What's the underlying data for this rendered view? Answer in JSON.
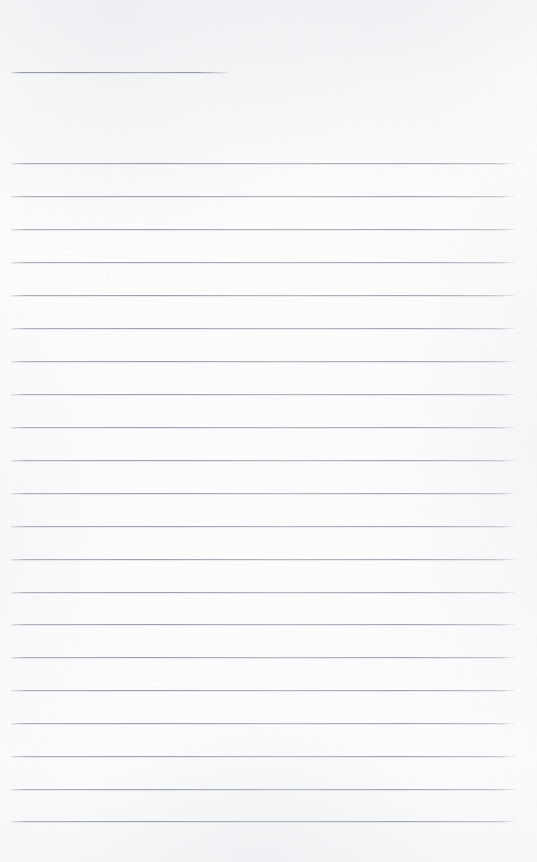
{
  "document": {
    "type": "scanned-lined-paper",
    "title": "Blank Lined Notebook Page",
    "page_width": 537,
    "page_height": 862,
    "content_text": "",
    "is_blank": true
  },
  "colors": {
    "paper": "#fcfcfd",
    "paper_edge": "#f6f7f8",
    "rule_line": "#9aa1ad",
    "rule_line_faint": "#c6cad3"
  },
  "layout": {
    "rule_left": 11,
    "rule_right": 515,
    "header_rule_right": 228,
    "line_spacing": 32.9
  },
  "rules": [
    {
      "name": "header-rule",
      "y": 72,
      "left": 11,
      "width": 217,
      "header": true
    },
    {
      "name": "rule-1",
      "y": 163,
      "left": 11,
      "width": 504,
      "header": false
    },
    {
      "name": "rule-2",
      "y": 196,
      "left": 11,
      "width": 504,
      "header": false
    },
    {
      "name": "rule-3",
      "y": 229,
      "left": 11,
      "width": 504,
      "header": false
    },
    {
      "name": "rule-4",
      "y": 262,
      "left": 11,
      "width": 504,
      "header": false
    },
    {
      "name": "rule-5",
      "y": 295,
      "left": 11,
      "width": 504,
      "header": false
    },
    {
      "name": "rule-6",
      "y": 328,
      "left": 11,
      "width": 504,
      "header": false
    },
    {
      "name": "rule-7",
      "y": 361,
      "left": 11,
      "width": 504,
      "header": false
    },
    {
      "name": "rule-8",
      "y": 394,
      "left": 11,
      "width": 504,
      "header": false
    },
    {
      "name": "rule-9",
      "y": 427,
      "left": 11,
      "width": 504,
      "header": false
    },
    {
      "name": "rule-10",
      "y": 460,
      "left": 11,
      "width": 504,
      "header": false
    },
    {
      "name": "rule-11",
      "y": 493,
      "left": 11,
      "width": 504,
      "header": false
    },
    {
      "name": "rule-12",
      "y": 526,
      "left": 11,
      "width": 504,
      "header": false
    },
    {
      "name": "rule-13",
      "y": 559,
      "left": 11,
      "width": 504,
      "header": false
    },
    {
      "name": "rule-14",
      "y": 592,
      "left": 11,
      "width": 504,
      "header": false
    },
    {
      "name": "rule-15",
      "y": 624,
      "left": 11,
      "width": 504,
      "header": false
    },
    {
      "name": "rule-16",
      "y": 657,
      "left": 11,
      "width": 504,
      "header": false
    },
    {
      "name": "rule-17",
      "y": 690,
      "left": 11,
      "width": 504,
      "header": false
    },
    {
      "name": "rule-18",
      "y": 723,
      "left": 11,
      "width": 504,
      "header": false
    },
    {
      "name": "rule-19",
      "y": 756,
      "left": 11,
      "width": 504,
      "header": false
    },
    {
      "name": "rule-20",
      "y": 789,
      "left": 11,
      "width": 504,
      "header": false
    },
    {
      "name": "rule-21",
      "y": 821,
      "left": 11,
      "width": 504,
      "header": false
    }
  ]
}
